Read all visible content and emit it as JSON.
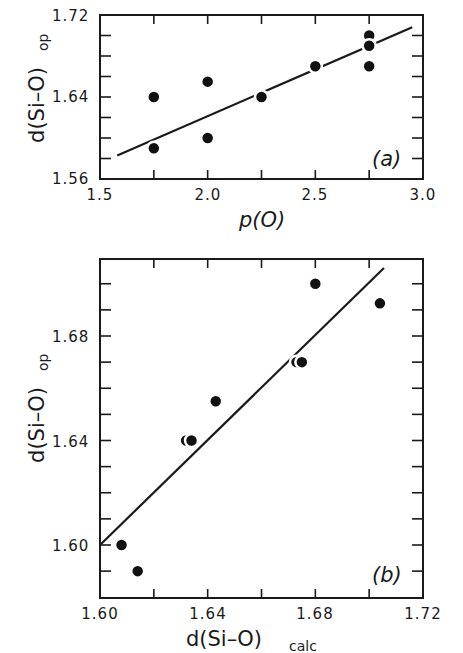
{
  "chart_data": [
    {
      "panel": "(a)",
      "type": "scatter",
      "title": "",
      "xlabel": "p(O)",
      "ylabel": "d(Si-O)op",
      "xlim": [
        1.5,
        3.0
      ],
      "ylim": [
        1.56,
        1.72
      ],
      "x_ticks": [
        "1.5",
        "2.0",
        "2.5",
        "3.0"
      ],
      "y_ticks": [
        "1.56",
        "1.64",
        "1.72"
      ],
      "x_minor_step": 0.25,
      "y_minor_step": 0.02,
      "grid": false,
      "series": [
        {
          "name": "observed",
          "points": [
            {
              "x": 1.75,
              "y": 1.59
            },
            {
              "x": 1.75,
              "y": 1.64
            },
            {
              "x": 2.0,
              "y": 1.655
            },
            {
              "x": 2.0,
              "y": 1.6
            },
            {
              "x": 2.25,
              "y": 1.64
            },
            {
              "x": 2.5,
              "y": 1.67
            },
            {
              "x": 2.75,
              "y": 1.7
            },
            {
              "x": 2.75,
              "y": 1.69
            },
            {
              "x": 2.75,
              "y": 1.67
            }
          ]
        },
        {
          "name": "fit-line",
          "line": [
            {
              "x": 1.58,
              "y": 1.583
            },
            {
              "x": 2.95,
              "y": 1.708
            }
          ]
        }
      ]
    },
    {
      "panel": "(b)",
      "type": "scatter",
      "title": "",
      "xlabel": "d(Si-O)calc",
      "ylabel": "d(Si-O)op",
      "xlim": [
        1.6,
        1.72
      ],
      "ylim": [
        1.58,
        1.71
      ],
      "x_ticks": [
        "1.60",
        "1.64",
        "1.68",
        "1.72"
      ],
      "y_ticks": [
        "1.60",
        "1.64",
        "1.68"
      ],
      "x_minor_step": 0.02,
      "y_minor_step": 0.01,
      "grid": false,
      "series": [
        {
          "name": "observed-vs-calculated",
          "points": [
            {
              "x": 1.608,
              "y": 1.6
            },
            {
              "x": 1.614,
              "y": 1.59
            },
            {
              "x": 1.632,
              "y": 1.64
            },
            {
              "x": 1.634,
              "y": 1.64
            },
            {
              "x": 1.643,
              "y": 1.655
            },
            {
              "x": 1.673,
              "y": 1.67
            },
            {
              "x": 1.675,
              "y": 1.67
            },
            {
              "x": 1.68,
              "y": 1.7
            },
            {
              "x": 1.704,
              "y": 1.6925
            }
          ]
        },
        {
          "name": "fit-line",
          "line": [
            {
              "x": 1.6,
              "y": 1.6
            },
            {
              "x": 1.7055,
              "y": 1.706
            }
          ]
        }
      ]
    }
  ],
  "labels": {
    "a": {
      "y_axis_main": "d(Si–O)",
      "y_axis_sub": "op",
      "x_axis": "p(O)",
      "panel": "(a)",
      "x_tick_labels": [
        "1.5",
        "2.0",
        "2.5",
        "3.0"
      ],
      "y_tick_labels": [
        "1.56",
        "1.64",
        "1.72"
      ]
    },
    "b": {
      "y_axis_main": "d(Si–O)",
      "y_axis_sub": "op",
      "x_axis_main": "d(Si–O)",
      "x_axis_sub": "calc",
      "panel": "(b)",
      "x_tick_labels": [
        "1.60",
        "1.64",
        "1.68",
        "1.72"
      ],
      "y_tick_labels": [
        "1.60",
        "1.64",
        "1.68"
      ]
    }
  }
}
